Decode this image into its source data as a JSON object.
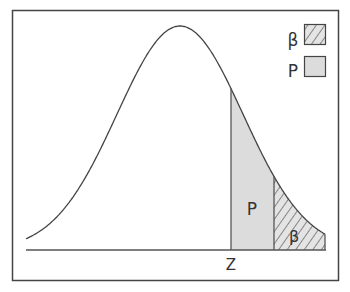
{
  "diagram": {
    "type": "normal-distribution-power",
    "axis_label": "Z",
    "region_labels": {
      "p": "P",
      "beta": "β"
    },
    "legend": [
      {
        "symbol": "β",
        "swatch": "hatched"
      },
      {
        "symbol": "P",
        "swatch": "gray"
      }
    ],
    "colors": {
      "frame": "#444444",
      "curve": "#444444",
      "fill_gray": "#dddddd",
      "hatch": "#444444"
    }
  }
}
